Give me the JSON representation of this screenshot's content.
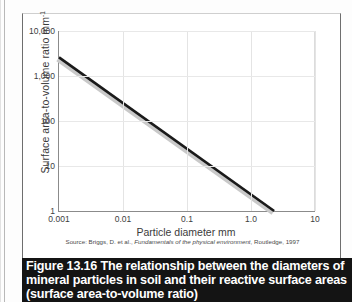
{
  "figure": {
    "caption_number": "Figure 13.16",
    "caption_body": "The relationship between the diameters of mineral particles in soil and their reactive surface areas (surface area-to-volume ratio)",
    "source_prefix": "Source: Briggs, D. et al., ",
    "source_title": "Fundamentals of the physical environment",
    "source_suffix": ", Routledge, 1997",
    "caption_bg": "#141414",
    "caption_fg": "#ffffff"
  },
  "chart_data": {
    "type": "line",
    "title": "",
    "xlabel": "Particle diameter mm",
    "ylabel": "Surface area-to-volume ratio mm",
    "ylabel_exponent": "-1",
    "xscale": "log",
    "yscale": "log",
    "xlim": [
      0.001,
      10
    ],
    "ylim": [
      1,
      10000
    ],
    "grid": true,
    "legend": "none",
    "xticks": [
      0.001,
      0.01,
      0.1,
      1.0,
      10
    ],
    "xticklabels": [
      "0.001",
      "0.01",
      "0.1",
      "1.0",
      "10"
    ],
    "yticks": [
      1,
      10,
      100,
      1000,
      10000
    ],
    "yticklabels": [
      "1",
      "10",
      "100",
      "1,000",
      "10,000"
    ],
    "series": [
      {
        "name": "surface area-to-volume ratio",
        "color": "#1a1a1a",
        "shadow_color": "#c9c9c9",
        "x": [
          0.001,
          2.3
        ],
        "y": [
          2600,
          1
        ]
      }
    ]
  }
}
